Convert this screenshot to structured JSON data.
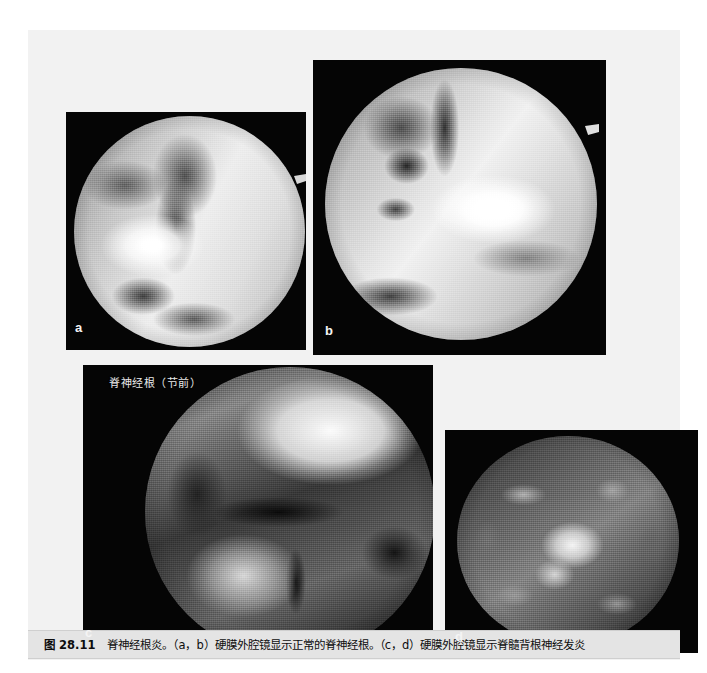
{
  "figure": {
    "number": "图 28.11",
    "caption": "脊神经根炎。（a，b）硬膜外腔镜显示正常的脊神经根。（c，d）硬膜外腔镜显示脊髓背根神经发炎",
    "caption_full": "图 28.11　脊神经根炎。（a，b）硬膜外腔镜显示正常的脊神经根。（c，d）硬膜外腔镜显示脊髓背根神经发炎"
  },
  "panels": [
    {
      "id": "a",
      "label": "a",
      "description": "硬膜外腔镜显示正常的脊神经根",
      "annotation": ""
    },
    {
      "id": "b",
      "label": "b",
      "description": "硬膜外腔镜显示正常的脊神经根",
      "annotation": ""
    },
    {
      "id": "c",
      "label": "c",
      "description": "硬膜外腔镜显示脊髓背根神经发炎",
      "annotation": "脊神经根（节前）"
    },
    {
      "id": "d",
      "label": "d",
      "description": "硬膜外腔镜显示脊髓背根神经发炎",
      "annotation": ""
    }
  ],
  "colors": {
    "page_background": "#ffffff",
    "sheet_background": "#f2f2f2",
    "panel_background": "#050505",
    "caption_background": "#e4e4e4",
    "label_text": "#f4f4f4",
    "caption_text": "#0d0d0d"
  }
}
